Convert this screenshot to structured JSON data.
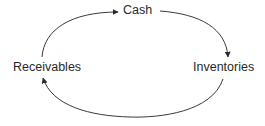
{
  "diagram": {
    "nodes": [
      {
        "id": "cash",
        "label": "Cash"
      },
      {
        "id": "inventories",
        "label": "Inventories"
      },
      {
        "id": "receivables",
        "label": "Receivables"
      }
    ],
    "edges": [
      {
        "from": "receivables",
        "to": "cash"
      },
      {
        "from": "cash",
        "to": "inventories"
      },
      {
        "from": "inventories",
        "to": "receivables"
      }
    ],
    "colors": {
      "line": "#3a3a3a",
      "text": "#2a2a2a",
      "background": "#ffffff"
    }
  }
}
